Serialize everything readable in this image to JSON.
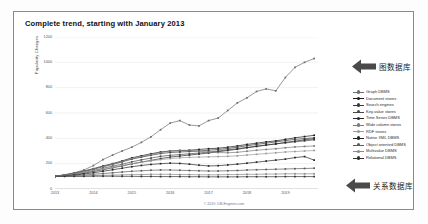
{
  "chart_data": {
    "type": "line",
    "title": "Complete trend, starting with January 2013",
    "xlabel": "",
    "ylabel": "Popularity Changes",
    "credit": "© 2019, DB-Engines.com",
    "xlim": [
      2013,
      2019.85
    ],
    "ylim": [
      0,
      1200
    ],
    "grid": true,
    "legend_position": "right",
    "x_ticks": [
      "2013",
      "2014",
      "2015",
      "2016",
      "2017",
      "2018",
      "2019"
    ],
    "y_ticks": [
      "0",
      "200",
      "400",
      "600",
      "800",
      "1000",
      "1200"
    ],
    "x": [
      2013.0,
      2013.25,
      2013.5,
      2013.75,
      2014.0,
      2014.25,
      2014.5,
      2014.75,
      2015.0,
      2015.25,
      2015.5,
      2015.75,
      2016.0,
      2016.25,
      2016.5,
      2016.75,
      2017.0,
      2017.25,
      2017.5,
      2017.75,
      2018.0,
      2018.25,
      2018.5,
      2018.75,
      2019.0,
      2019.25,
      2019.5,
      2019.75
    ],
    "series": [
      {
        "name": "Graph DBMS",
        "color": "#6d6d6d",
        "values": [
          100,
          112,
          128,
          150,
          185,
          232,
          268,
          300,
          330,
          368,
          412,
          468,
          520,
          540,
          505,
          498,
          540,
          560,
          620,
          680,
          720,
          770,
          790,
          775,
          880,
          960,
          1000,
          1030
        ]
      },
      {
        "name": "Document stores",
        "color": "#1a1a1a",
        "values": [
          100,
          112,
          126,
          142,
          160,
          182,
          200,
          222,
          246,
          262,
          278,
          292,
          300,
          302,
          306,
          312,
          318,
          322,
          330,
          340,
          352,
          362,
          372,
          380,
          392,
          404,
          414,
          424
        ]
      },
      {
        "name": "Search engines",
        "color": "#3a3a3a",
        "values": [
          100,
          110,
          122,
          138,
          156,
          176,
          194,
          214,
          236,
          252,
          266,
          280,
          288,
          292,
          296,
          300,
          306,
          312,
          320,
          330,
          342,
          352,
          362,
          372,
          382,
          392,
          398,
          404
        ]
      },
      {
        "name": "Key-value stores",
        "color": "#4a4a4a",
        "values": [
          100,
          108,
          118,
          130,
          146,
          164,
          180,
          196,
          214,
          230,
          244,
          258,
          266,
          272,
          278,
          284,
          292,
          300,
          310,
          318,
          328,
          338,
          348,
          356,
          364,
          372,
          380,
          388
        ]
      },
      {
        "name": "Time Series DBMS",
        "color": "#2a2a2a",
        "values": [
          100,
          106,
          114,
          124,
          138,
          152,
          168,
          182,
          198,
          212,
          226,
          240,
          252,
          260,
          268,
          276,
          284,
          294,
          304,
          314,
          326,
          336,
          346,
          356,
          368,
          378,
          388,
          396
        ]
      },
      {
        "name": "Wide column stores",
        "color": "#7a7a7a",
        "values": [
          100,
          110,
          124,
          140,
          158,
          178,
          196,
          218,
          240,
          256,
          272,
          288,
          300,
          306,
          304,
          298,
          292,
          288,
          286,
          290,
          298,
          306,
          312,
          318,
          326,
          332,
          336,
          340
        ]
      },
      {
        "name": "RDF stores",
        "color": "#9a9a9a",
        "values": [
          100,
          108,
          118,
          130,
          144,
          158,
          172,
          186,
          200,
          212,
          222,
          232,
          240,
          246,
          250,
          252,
          254,
          256,
          258,
          262,
          268,
          274,
          280,
          286,
          292,
          296,
          300,
          304
        ]
      },
      {
        "name": "Native XML DBMS",
        "color": "#252525",
        "values": [
          100,
          104,
          110,
          118,
          128,
          140,
          152,
          164,
          176,
          186,
          194,
          200,
          204,
          202,
          196,
          188,
          182,
          184,
          190,
          196,
          204,
          212,
          220,
          228,
          236,
          248,
          256,
          228
        ]
      },
      {
        "name": "Object oriented DBMS",
        "color": "#5a5a5a",
        "values": [
          100,
          102,
          106,
          110,
          116,
          122,
          128,
          134,
          140,
          144,
          148,
          150,
          150,
          148,
          146,
          144,
          142,
          142,
          144,
          146,
          150,
          152,
          154,
          156,
          158,
          160,
          162,
          164
        ]
      },
      {
        "name": "Multivalue DBMS",
        "color": "#8a8a8a",
        "values": [
          100,
          100,
          102,
          104,
          106,
          108,
          110,
          112,
          114,
          114,
          116,
          116,
          116,
          114,
          114,
          112,
          112,
          112,
          114,
          114,
          116,
          116,
          118,
          118,
          120,
          120,
          120,
          120
        ]
      },
      {
        "name": "Relational DBMS",
        "color": "#303030",
        "values": [
          100,
          100,
          100,
          100,
          101,
          101,
          101,
          100,
          100,
          99,
          99,
          98,
          98,
          98,
          97,
          97,
          96,
          96,
          96,
          96,
          97,
          97,
          97,
          97,
          98,
          98,
          98,
          98
        ]
      }
    ],
    "annotations": [
      {
        "id": "graph",
        "text": "图数据库",
        "points_to": "Graph DBMS",
        "arrow": "left-arrow-icon"
      },
      {
        "id": "relational",
        "text": "关系数据库",
        "points_to": "Relational DBMS",
        "arrow": "left-arrow-icon"
      }
    ]
  }
}
